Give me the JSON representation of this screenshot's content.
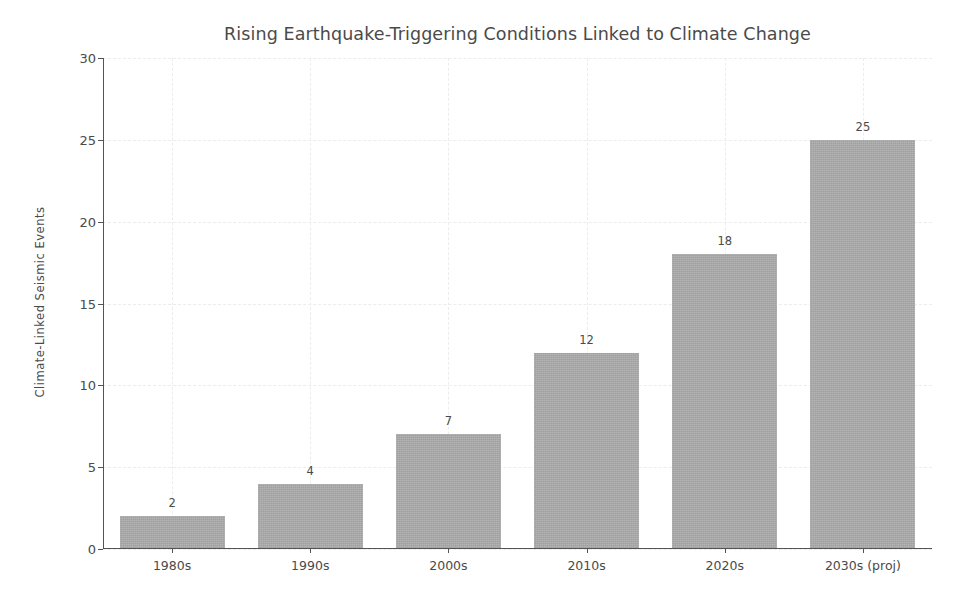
{
  "chart_data": {
    "type": "bar",
    "title": "Rising Earthquake-Triggering Conditions Linked to Climate Change",
    "xlabel": "",
    "ylabel": "Climate-Linked Seismic Events",
    "categories": [
      "1980s",
      "1990s",
      "2000s",
      "2010s",
      "2020s",
      "2030s (proj)"
    ],
    "values": [
      2,
      4,
      7,
      12,
      18,
      25
    ],
    "value_labels": [
      "2",
      "4",
      "7",
      "12",
      "18",
      "25"
    ],
    "ylim": [
      0,
      30
    ],
    "yticks": [
      0,
      5,
      10,
      15,
      20,
      25,
      30
    ],
    "ytick_labels": [
      "0",
      "5",
      "10",
      "15",
      "20",
      "25",
      "30"
    ],
    "grid": true,
    "grid_style": "dashed",
    "legend": false,
    "bar_color": "#a9a9a9",
    "axis_color": "#545454",
    "text_color": "#4a4a4a",
    "grid_color": "#ececec",
    "background_color": "#ffffff"
  }
}
